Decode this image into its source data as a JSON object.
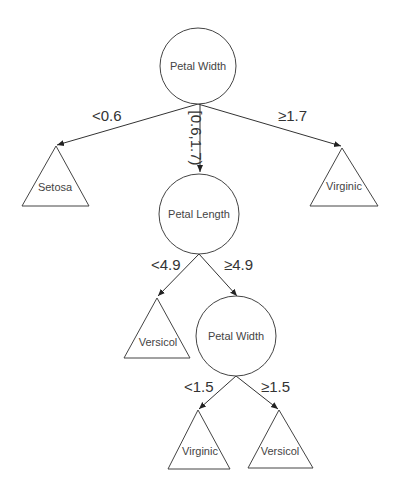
{
  "diagram": {
    "type": "decision-tree",
    "colors": {
      "stroke": "#444444",
      "text": "#444444",
      "background": "#ffffff"
    },
    "nodes": [
      {
        "id": "root",
        "shape": "circle",
        "label": "Petal Width",
        "cx": 198,
        "cy": 66,
        "r": 38
      },
      {
        "id": "setosa",
        "shape": "triangle",
        "label": "Setosa",
        "apex": [
          56,
          145
        ],
        "base": [
          22,
          89,
          206
        ]
      },
      {
        "id": "virginic-1",
        "shape": "triangle",
        "label": "Virginic",
        "apex": [
          342,
          147
        ],
        "base": [
          310,
          378,
          206
        ]
      },
      {
        "id": "petal-length",
        "shape": "circle",
        "label": "Petal Length",
        "cx": 199,
        "cy": 214,
        "r": 40
      },
      {
        "id": "versicol-1",
        "shape": "triangle",
        "label": "Versicol",
        "apex": [
          157,
          297
        ],
        "base": [
          124,
          190,
          358
        ]
      },
      {
        "id": "petal-width-2",
        "shape": "circle",
        "label": "Petal Width",
        "cx": 236,
        "cy": 336,
        "r": 40
      },
      {
        "id": "virginic-2",
        "shape": "triangle",
        "label": "Virginic",
        "apex": [
          198,
          410
        ],
        "base": [
          168,
          230,
          469
        ]
      },
      {
        "id": "versicol-2",
        "shape": "triangle",
        "label": "Versicol",
        "apex": [
          279,
          410
        ],
        "base": [
          248,
          313,
          468
        ]
      }
    ],
    "edges": [
      {
        "from": "root",
        "to": "setosa",
        "label": "<0.6"
      },
      {
        "from": "root",
        "to": "petal-length",
        "label": "[0.6,1.7)"
      },
      {
        "from": "root",
        "to": "virginic-1",
        "label": "≥1.7"
      },
      {
        "from": "petal-length",
        "to": "versicol-1",
        "label": "<4.9"
      },
      {
        "from": "petal-length",
        "to": "petal-width-2",
        "label": "≥4.9"
      },
      {
        "from": "petal-width-2",
        "to": "virginic-2",
        "label": "<1.5"
      },
      {
        "from": "petal-width-2",
        "to": "versicol-2",
        "label": "≥1.5"
      }
    ]
  },
  "labels": {
    "root": "Petal Width",
    "setosa": "Setosa",
    "virginic_1": "Virginic",
    "petal_length": "Petal Length",
    "versicol_1": "Versicol",
    "petal_width_2": "Petal Width",
    "virginic_2": "Virginic",
    "versicol_2": "Versicol",
    "edge_lt_06": "<0.6",
    "edge_mid": "[0.6,1.7)",
    "edge_ge_17": "≥1.7",
    "edge_lt_49": "<4.9",
    "edge_ge_49": "≥4.9",
    "edge_lt_15": "<1.5",
    "edge_ge_15": "≥1.5"
  }
}
